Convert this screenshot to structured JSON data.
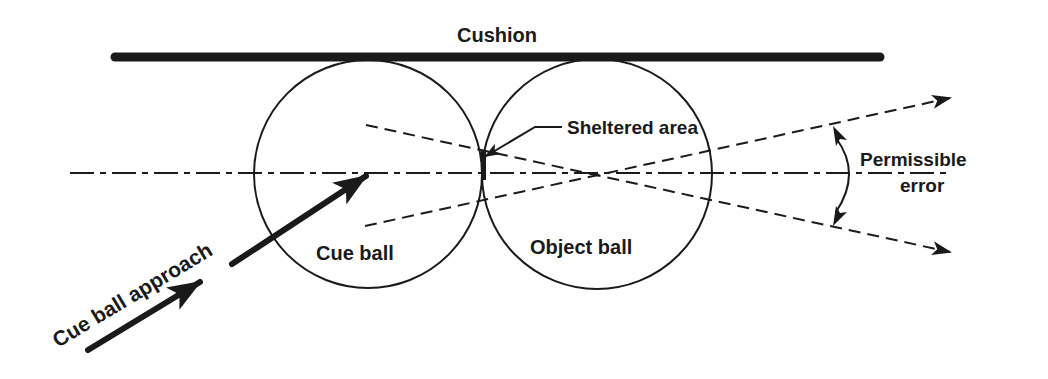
{
  "diagram": {
    "type": "billiards-shot-geometry",
    "labels": {
      "cushion": "Cushion",
      "sheltered_area": "Sheltered area",
      "permissible_line1": "Permissible",
      "permissible_line2": "error",
      "cue_ball": "Cue ball",
      "object_ball": "Object ball",
      "cue_ball_approach": "Cue ball approach"
    },
    "colors": {
      "ink": "#1a1a1a",
      "background": "#ffffff"
    },
    "elements": {
      "cushion_bar": {
        "x1": 115,
        "x2": 880,
        "y": 57
      },
      "cue_ball": {
        "cx": 368,
        "cy": 174,
        "r": 114
      },
      "object_ball": {
        "cx": 597,
        "cy": 174,
        "r": 115
      },
      "centerline": {
        "x1": 70,
        "x2": 950,
        "y": 173
      },
      "error_line_upper": {
        "from": [
          365,
          226
        ],
        "to": [
          950,
          98
        ]
      },
      "error_line_lower": {
        "from": [
          366,
          125
        ],
        "to": [
          950,
          252
        ]
      },
      "approach_arrows": [
        {
          "from": [
            88,
            350
          ],
          "to": [
            200,
            282
          ]
        },
        {
          "from": [
            230,
            264
          ],
          "to": [
            366,
            175
          ]
        }
      ]
    }
  }
}
